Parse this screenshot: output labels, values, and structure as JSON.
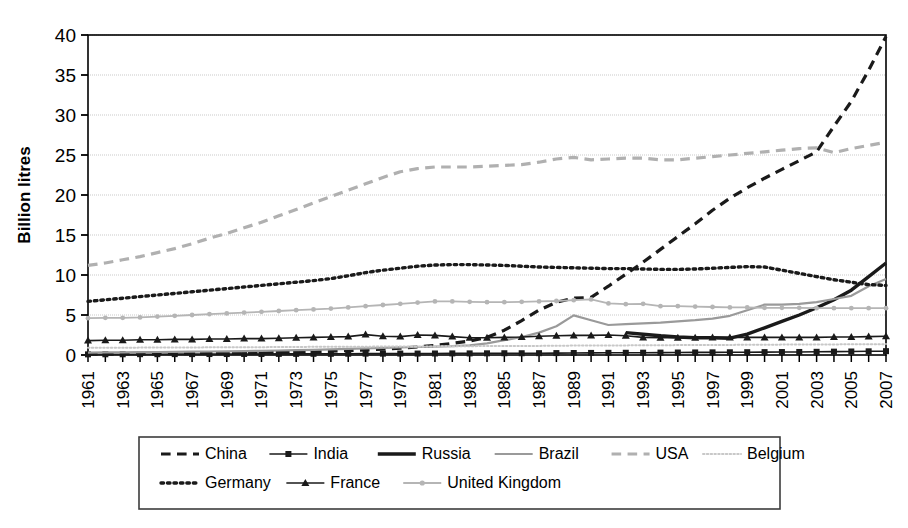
{
  "chart_data": {
    "type": "line",
    "title": "",
    "xlabel": "",
    "ylabel": "Billion litres",
    "ylim": [
      0,
      40
    ],
    "ytick_values": [
      0,
      5,
      10,
      15,
      20,
      25,
      30,
      35,
      40
    ],
    "ytick_labels": [
      "0",
      "5",
      "10",
      "15",
      "20",
      "25",
      "30",
      "35",
      "40"
    ],
    "grid": true,
    "grid_axis": "y",
    "legend_position": "bottom",
    "x_start": 1961,
    "x_end": 2007,
    "x": [
      1961,
      1962,
      1963,
      1964,
      1965,
      1966,
      1967,
      1968,
      1969,
      1970,
      1971,
      1972,
      1973,
      1974,
      1975,
      1976,
      1977,
      1978,
      1979,
      1980,
      1981,
      1982,
      1983,
      1984,
      1985,
      1986,
      1987,
      1988,
      1989,
      1990,
      1991,
      1992,
      1993,
      1994,
      1995,
      1996,
      1997,
      1998,
      1999,
      2000,
      2001,
      2002,
      2003,
      2004,
      2005,
      2006,
      2007
    ],
    "xtick_labels": [
      "1961",
      "1963",
      "1965",
      "1967",
      "1969",
      "1971",
      "1973",
      "1975",
      "1977",
      "1979",
      "1981",
      "1983",
      "1985",
      "1987",
      "1989",
      "1991",
      "1993",
      "1995",
      "1997",
      "1999",
      "2001",
      "2003",
      "2005",
      "2007"
    ],
    "series": [
      {
        "name": "China",
        "style": "dashed",
        "color": "#1a1a1a",
        "width": 3.2,
        "marker": "none",
        "values": [
          0.1,
          0.11,
          0.12,
          0.13,
          0.15,
          0.17,
          0.18,
          0.2,
          0.22,
          0.25,
          0.28,
          0.32,
          0.36,
          0.42,
          0.48,
          0.55,
          0.62,
          0.72,
          0.85,
          1.0,
          1.2,
          1.45,
          1.75,
          2.2,
          3.1,
          4.3,
          5.6,
          6.6,
          7.1,
          7.2,
          8.6,
          10.1,
          11.6,
          13.2,
          14.8,
          16.4,
          18.1,
          19.6,
          20.9,
          22.1,
          23.2,
          24.3,
          25.4,
          28.6,
          31.7,
          35.6,
          39.8
        ]
      },
      {
        "name": "India",
        "style": "solid",
        "color": "#1a1a1a",
        "width": 1.6,
        "marker": "square",
        "values": [
          0.08,
          0.09,
          0.09,
          0.1,
          0.1,
          0.11,
          0.11,
          0.12,
          0.12,
          0.13,
          0.13,
          0.14,
          0.14,
          0.15,
          0.15,
          0.16,
          0.17,
          0.17,
          0.18,
          0.18,
          0.19,
          0.2,
          0.2,
          0.21,
          0.22,
          0.22,
          0.23,
          0.24,
          0.25,
          0.26,
          0.27,
          0.28,
          0.29,
          0.3,
          0.31,
          0.32,
          0.33,
          0.34,
          0.35,
          0.36,
          0.37,
          0.38,
          0.4,
          0.42,
          0.44,
          0.46,
          0.48
        ]
      },
      {
        "name": "Russia",
        "style": "solid",
        "color": "#1a1a1a",
        "width": 3.4,
        "marker": "none",
        "start_year": 1992,
        "values": [
          null,
          null,
          null,
          null,
          null,
          null,
          null,
          null,
          null,
          null,
          null,
          null,
          null,
          null,
          null,
          null,
          null,
          null,
          null,
          null,
          null,
          null,
          null,
          null,
          null,
          null,
          null,
          null,
          null,
          null,
          null,
          2.8,
          2.6,
          2.4,
          2.25,
          2.15,
          2.15,
          2.1,
          2.6,
          3.4,
          4.2,
          5.0,
          5.9,
          6.9,
          8.1,
          9.8,
          11.5
        ]
      },
      {
        "name": "Brazil",
        "style": "solid",
        "color": "#9a9a9a",
        "width": 2.2,
        "marker": "none",
        "values": [
          0.3,
          0.32,
          0.34,
          0.36,
          0.38,
          0.4,
          0.42,
          0.44,
          0.46,
          0.48,
          0.52,
          0.56,
          0.6,
          0.65,
          0.7,
          0.76,
          0.82,
          0.88,
          0.95,
          1.0,
          1.05,
          1.1,
          1.2,
          1.45,
          1.85,
          2.25,
          2.8,
          3.6,
          4.95,
          4.35,
          3.75,
          3.85,
          3.95,
          4.05,
          4.2,
          4.35,
          4.55,
          4.9,
          5.6,
          6.3,
          6.3,
          6.4,
          6.6,
          7.0,
          7.4,
          8.6,
          9.5
        ]
      },
      {
        "name": "USA",
        "style": "dashed",
        "color": "#b0b0b0",
        "width": 3.2,
        "marker": "none",
        "values": [
          11.2,
          11.5,
          11.9,
          12.3,
          12.8,
          13.3,
          13.9,
          14.6,
          15.2,
          15.9,
          16.6,
          17.4,
          18.2,
          19.0,
          19.8,
          20.6,
          21.4,
          22.2,
          22.9,
          23.3,
          23.5,
          23.5,
          23.5,
          23.6,
          23.7,
          23.8,
          24.1,
          24.5,
          24.7,
          24.4,
          24.5,
          24.6,
          24.6,
          24.4,
          24.4,
          24.6,
          24.8,
          25.0,
          25.2,
          25.4,
          25.6,
          25.8,
          25.9,
          25.3,
          25.8,
          26.2,
          26.6
        ]
      },
      {
        "name": "Belgium",
        "style": "dotted",
        "color": "#c8c8c8",
        "width": 2.0,
        "marker": "none",
        "values": [
          0.9,
          0.9,
          0.9,
          0.92,
          0.92,
          0.94,
          0.94,
          0.96,
          0.96,
          0.98,
          0.98,
          1.0,
          1.0,
          1.02,
          1.02,
          1.04,
          1.04,
          1.06,
          1.06,
          1.08,
          1.08,
          1.1,
          1.1,
          1.12,
          1.12,
          1.14,
          1.14,
          1.16,
          1.18,
          1.18,
          1.2,
          1.2,
          1.22,
          1.22,
          1.24,
          1.24,
          1.26,
          1.26,
          1.28,
          1.28,
          1.3,
          1.3,
          1.32,
          1.32,
          1.34,
          1.34,
          1.36
        ]
      },
      {
        "name": "Germany",
        "style": "dotted",
        "color": "#1a1a1a",
        "width": 3.4,
        "marker": "none",
        "values": [
          6.7,
          6.9,
          7.1,
          7.3,
          7.5,
          7.7,
          7.9,
          8.1,
          8.3,
          8.5,
          8.7,
          8.9,
          9.1,
          9.3,
          9.55,
          9.9,
          10.3,
          10.6,
          10.85,
          11.1,
          11.25,
          11.3,
          11.3,
          11.25,
          11.2,
          11.1,
          11.0,
          10.95,
          10.9,
          10.85,
          10.8,
          10.8,
          10.75,
          10.7,
          10.7,
          10.75,
          10.85,
          10.95,
          11.05,
          11.0,
          10.6,
          10.2,
          9.8,
          9.4,
          9.1,
          8.8,
          8.7
        ]
      },
      {
        "name": "France",
        "style": "solid",
        "color": "#1a1a1a",
        "width": 1.6,
        "marker": "triangle",
        "values": [
          1.8,
          1.85,
          1.85,
          1.9,
          1.9,
          1.95,
          1.95,
          2.0,
          2.0,
          2.05,
          2.05,
          2.1,
          2.15,
          2.2,
          2.25,
          2.3,
          2.55,
          2.35,
          2.3,
          2.5,
          2.45,
          2.3,
          2.15,
          2.15,
          2.2,
          2.25,
          2.35,
          2.4,
          2.45,
          2.45,
          2.5,
          2.4,
          2.2,
          2.15,
          2.15,
          2.15,
          2.2,
          2.2,
          2.2,
          2.2,
          2.2,
          2.2,
          2.2,
          2.25,
          2.25,
          2.3,
          2.35
        ]
      },
      {
        "name": "United Kingdom",
        "style": "solid",
        "color": "#b5b5b5",
        "width": 1.8,
        "marker": "star",
        "values": [
          4.6,
          4.65,
          4.65,
          4.7,
          4.8,
          4.9,
          5.0,
          5.1,
          5.2,
          5.3,
          5.4,
          5.5,
          5.6,
          5.7,
          5.8,
          5.95,
          6.1,
          6.25,
          6.4,
          6.55,
          6.7,
          6.7,
          6.65,
          6.6,
          6.6,
          6.65,
          6.7,
          6.75,
          6.85,
          6.95,
          6.45,
          6.35,
          6.4,
          6.1,
          6.1,
          6.05,
          6.0,
          5.95,
          5.95,
          5.9,
          5.9,
          5.9,
          5.85,
          5.85,
          5.85,
          5.85,
          5.85
        ]
      }
    ]
  },
  "legend": {
    "rows": [
      [
        {
          "name": "China",
          "style": "dashed",
          "color": "#1a1a1a",
          "marker": "none"
        },
        {
          "name": "India",
          "style": "solid",
          "color": "#1a1a1a",
          "marker": "square"
        },
        {
          "name": "Russia",
          "style": "solid",
          "color": "#1a1a1a",
          "marker": "none"
        },
        {
          "name": "Brazil",
          "style": "solid",
          "color": "#9a9a9a",
          "marker": "none"
        },
        {
          "name": "USA",
          "style": "dashed",
          "color": "#b0b0b0",
          "marker": "none"
        },
        {
          "name": "Belgium",
          "style": "dotted",
          "color": "#c8c8c8",
          "marker": "none"
        }
      ],
      [
        {
          "name": "Germany",
          "style": "dotted",
          "color": "#1a1a1a",
          "marker": "none"
        },
        {
          "name": "France",
          "style": "solid",
          "color": "#1a1a1a",
          "marker": "triangle"
        },
        {
          "name": "United Kingdom",
          "style": "solid",
          "color": "#b5b5b5",
          "marker": "star"
        }
      ]
    ]
  },
  "colors": {
    "axis": "#000000",
    "grid": "#c9c9c9",
    "background": "#ffffff",
    "legend_border": "#3c3c3c"
  }
}
